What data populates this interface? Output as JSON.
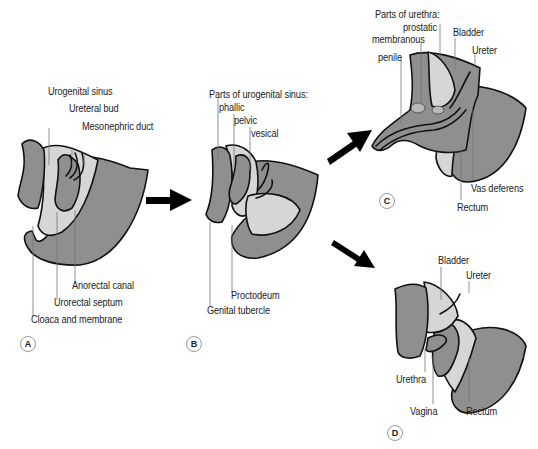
{
  "figure": {
    "panels": [
      {
        "id": "A",
        "title": "",
        "labels": {
          "urogenital_sinus": "Urogenital sinus",
          "ureteral_bud": "Ureteral bud",
          "mesonephric_duct": "Mesonephric duct",
          "anorectal_canal": "Anorectal canal",
          "urorectal_septum": "Urorectal septum",
          "cloaca_membrane": "Cloaca and membrane"
        }
      },
      {
        "id": "B",
        "title": "Parts of urogenital sinus:",
        "labels": {
          "phallic": "phallic",
          "pelvic": "pelvic",
          "vesical": "vesical",
          "proctodeum": "Proctodeum",
          "genital_tubercle": "Genital tubercle"
        }
      },
      {
        "id": "C",
        "title": "Parts of urethra:",
        "labels": {
          "prostatic": "prostatic",
          "membranous": "membranous",
          "penile": "penile",
          "bladder": "Bladder",
          "ureter": "Ureter",
          "vas_deferens": "Vas deferens",
          "rectum": "Rectum"
        }
      },
      {
        "id": "D",
        "title": "",
        "labels": {
          "bladder": "Bladder",
          "ureter": "Ureter",
          "urethra": "Urethra",
          "vagina": "Vagina",
          "rectum": "Rectum"
        }
      }
    ],
    "arrows": [
      "A-to-B",
      "B-to-C",
      "B-to-D"
    ],
    "colors": {
      "dark_tissue": "#8f8f8f",
      "light_tissue": "#d6d6d6",
      "outline": "#111111",
      "leader_line": "#777777"
    }
  }
}
